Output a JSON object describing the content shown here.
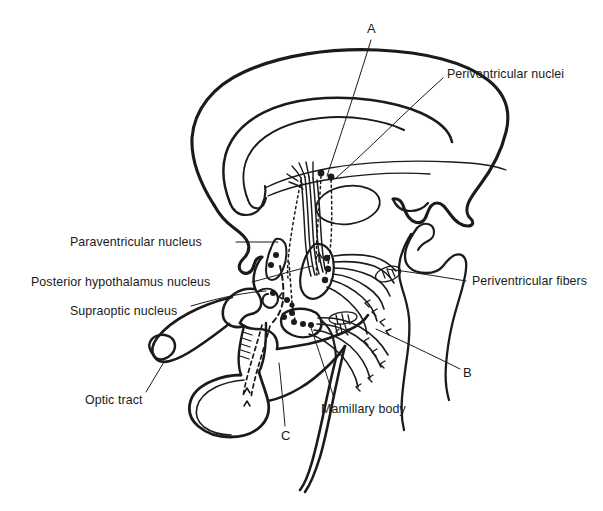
{
  "figure": {
    "type": "anatomical-line-diagram",
    "background_color": "#ffffff",
    "ink_color": "#1b1b1b"
  },
  "labels": {
    "periventricular_nuclei": "Periventricular nuclei",
    "periventricular_fibers": "Periventricular fibers",
    "paraventricular_nucleus": "Paraventricular nucleus",
    "posterior_hypothalamus_nucleus": "Posterior hypothalamus nucleus",
    "supraoptic_nucleus": "Supraoptic nucleus",
    "optic_tract": "Optic tract",
    "mamillary_body": "Mamillary body",
    "marker_a": "A",
    "marker_b": "B",
    "marker_c": "C"
  }
}
